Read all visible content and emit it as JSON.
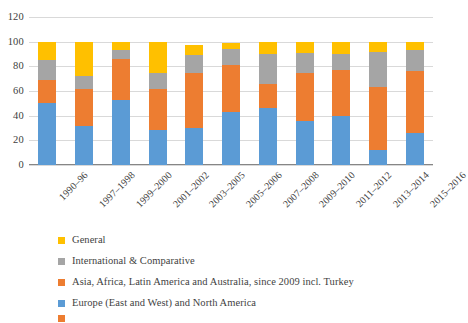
{
  "chart_data": {
    "type": "bar",
    "stacked": true,
    "stack_mode": "stacked",
    "title": "",
    "subtitle": "",
    "xlabel": "",
    "ylabel": "",
    "ylim": [
      0,
      120
    ],
    "yticks": [
      0,
      20,
      40,
      60,
      80,
      100,
      120
    ],
    "ytick_labels": [
      "0",
      "20",
      "40",
      "60",
      "80",
      "100",
      "120"
    ],
    "grid": true,
    "grid_axis": "y",
    "legend_position": "bottom-left",
    "categories": [
      "1990–96",
      "1997–1998",
      "1999–2000",
      "2001–2002",
      "2003–2005",
      "2005–2006",
      "2007–2008",
      "2009–2010",
      "2011–2012",
      "2013–2014",
      "2015–2016"
    ],
    "series": [
      {
        "name": "Europe (East and West) and North America",
        "color": "#5B9BD5",
        "values": [
          50,
          32,
          53,
          28,
          30,
          43,
          46,
          36,
          40,
          12,
          26
        ]
      },
      {
        "name": "Asia, Africa, Latin America and Australia, since 2009 incl. Turkey",
        "color": "#ED7D31",
        "values": [
          19,
          30,
          33,
          34,
          45,
          38,
          20,
          39,
          37,
          51,
          50
        ]
      },
      {
        "name": "International & Comparative",
        "color": "#A5A5A5",
        "values": [
          16,
          10,
          7,
          13,
          14,
          13,
          24,
          16,
          13,
          29,
          17
        ]
      },
      {
        "name": "General",
        "color": "#FFC000",
        "values": [
          15,
          28,
          7,
          25,
          8,
          5,
          10,
          9,
          10,
          8,
          7
        ]
      }
    ],
    "stack_totals": [
      100,
      100,
      100,
      100,
      97,
      99,
      100,
      100,
      100,
      100,
      100
    ]
  },
  "legend": {
    "items": [
      {
        "label": "General",
        "color": "#FFC000"
      },
      {
        "label": "International & Comparative",
        "color": "#A5A5A5"
      },
      {
        "label": "Asia, Africa, Latin America and Australia, since 2009 incl. Turkey",
        "color": "#ED7D31"
      },
      {
        "label": "Europe (East and West) and North America",
        "color": "#5B9BD5"
      },
      {
        "label": "",
        "color": "#ED7D31"
      }
    ]
  },
  "axis": {
    "y_ticks": [
      "120",
      "100",
      "80",
      "60",
      "40",
      "20",
      "0"
    ],
    "x_ticks": [
      "1990–96",
      "1997–1998",
      "1999–2000",
      "2001–2002",
      "2003–2005",
      "2005–2006",
      "2007–2008",
      "2009–2010",
      "2011–2012",
      "2013–2014",
      "2015–2016"
    ]
  }
}
